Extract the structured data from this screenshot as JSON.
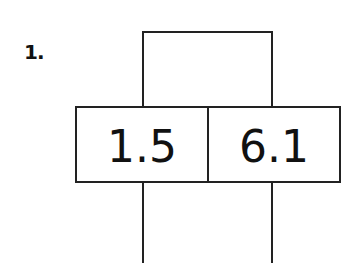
{
  "problem": {
    "number_label": "1.",
    "cells": [
      {
        "value": "1.5"
      },
      {
        "value": "6.1"
      }
    ]
  },
  "colors": {
    "line": "#222222",
    "text": "#111111",
    "background": "#ffffff"
  }
}
